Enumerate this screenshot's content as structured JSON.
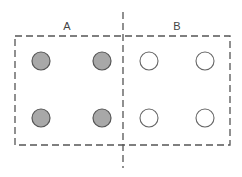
{
  "diagram": {
    "labels": {
      "left": "A",
      "right": "B"
    },
    "colors": {
      "stroke": "#555555",
      "filled": "#a8a8a8",
      "open": "#ffffff"
    },
    "groups": [
      {
        "name": "A",
        "circles": [
          {
            "type": "filled"
          },
          {
            "type": "filled"
          },
          {
            "type": "filled"
          },
          {
            "type": "filled"
          }
        ]
      },
      {
        "name": "B",
        "circles": [
          {
            "type": "open"
          },
          {
            "type": "open"
          },
          {
            "type": "open"
          },
          {
            "type": "open"
          }
        ]
      }
    ]
  }
}
